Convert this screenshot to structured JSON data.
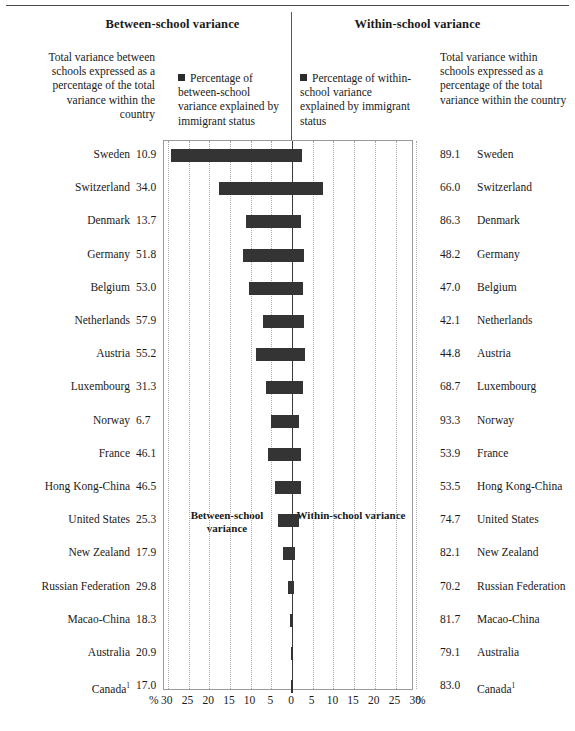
{
  "headers": {
    "left_title": "Between-school variance",
    "right_title": "Within-school variance",
    "left_blurb": "Total variance between schools expressed as a percentage of the total variance within the country",
    "right_blurb": "Total variance within schools expressed as a percentage of the total variance within the country"
  },
  "legend": {
    "left_label": "Percentage of between-school variance explained by immigrant status",
    "right_label": "Percentage of within-school variance explained by immigrant status",
    "marker_color": "#2b2b2b"
  },
  "inplot": {
    "left_label": "Between-school variance",
    "right_label": "Within-school variance"
  },
  "axis": {
    "left_unit": "%",
    "right_unit": "%",
    "ticks_left": [
      "30",
      "25",
      "20",
      "15",
      "10",
      "5"
    ],
    "tick_zero": "0",
    "ticks_right": [
      "5",
      "10",
      "15",
      "20",
      "25",
      "30"
    ]
  },
  "chart_data": {
    "type": "bar",
    "xlabel": "%",
    "ylabel": "",
    "xlim": [
      -30,
      30
    ],
    "grid": true,
    "orientation": "horizontal",
    "legend_position": "top",
    "categories": [
      "Sweden",
      "Switzerland",
      "Denmark",
      "Germany",
      "Belgium",
      "Netherlands",
      "Austria",
      "Luxembourg",
      "Norway",
      "France",
      "Hong Kong-China",
      "United States",
      "New Zealand",
      "Russian Federation",
      "Macao-China",
      "Australia",
      "Canada"
    ],
    "series": [
      {
        "name": "Total variance between schools expressed as a percentage of the total variance within the country",
        "values": [
          10.9,
          34.0,
          13.7,
          51.8,
          53.0,
          57.9,
          55.2,
          31.3,
          6.7,
          46.1,
          46.5,
          25.3,
          17.9,
          29.8,
          18.3,
          20.9,
          17.0
        ]
      },
      {
        "name": "Total variance within schools expressed as a percentage of the total variance within the country",
        "values": [
          89.1,
          66.0,
          86.3,
          48.2,
          47.0,
          42.1,
          44.8,
          68.7,
          93.3,
          53.9,
          53.5,
          74.7,
          82.1,
          70.2,
          81.7,
          79.1,
          83.0
        ]
      },
      {
        "name": "Percentage of between-school variance explained by immigrant status",
        "values": [
          29.2,
          17.6,
          11.2,
          11.8,
          10.4,
          7.0,
          8.6,
          6.3,
          5.0,
          5.8,
          4.1,
          3.4,
          2.2,
          0.9,
          0.6,
          0.2,
          0.2
        ]
      },
      {
        "name": "Percentage of within-school variance explained by immigrant status",
        "values": [
          2.4,
          7.5,
          2.1,
          2.9,
          2.7,
          2.9,
          3.1,
          2.6,
          1.6,
          2.2,
          2.2,
          1.8,
          0.8,
          0.4,
          0.3,
          0.2,
          0.2
        ]
      }
    ],
    "rows": [
      {
        "country": "Sweden",
        "footnote": "",
        "between_total": "10.9",
        "within_total": "89.1",
        "bar_left": 29.2,
        "bar_right": 2.4
      },
      {
        "country": "Switzerland",
        "footnote": "",
        "between_total": "34.0",
        "within_total": "66.0",
        "bar_left": 17.6,
        "bar_right": 7.5
      },
      {
        "country": "Denmark",
        "footnote": "",
        "between_total": "13.7",
        "within_total": "86.3",
        "bar_left": 11.2,
        "bar_right": 2.1
      },
      {
        "country": "Germany",
        "footnote": "",
        "between_total": "51.8",
        "within_total": "48.2",
        "bar_left": 11.8,
        "bar_right": 2.9
      },
      {
        "country": "Belgium",
        "footnote": "",
        "between_total": "53.0",
        "within_total": "47.0",
        "bar_left": 10.4,
        "bar_right": 2.7
      },
      {
        "country": "Netherlands",
        "footnote": "",
        "between_total": "57.9",
        "within_total": "42.1",
        "bar_left": 7.0,
        "bar_right": 2.9
      },
      {
        "country": "Austria",
        "footnote": "",
        "between_total": "55.2",
        "within_total": "44.8",
        "bar_left": 8.6,
        "bar_right": 3.1
      },
      {
        "country": "Luxembourg",
        "footnote": "",
        "between_total": "31.3",
        "within_total": "68.7",
        "bar_left": 6.3,
        "bar_right": 2.6
      },
      {
        "country": "Norway",
        "footnote": "",
        "between_total": "6.7",
        "within_total": "93.3",
        "bar_left": 5.0,
        "bar_right": 1.6
      },
      {
        "country": "France",
        "footnote": "",
        "between_total": "46.1",
        "within_total": "53.9",
        "bar_left": 5.8,
        "bar_right": 2.2
      },
      {
        "country": "Hong Kong-China",
        "footnote": "",
        "between_total": "46.5",
        "within_total": "53.5",
        "bar_left": 4.1,
        "bar_right": 2.2
      },
      {
        "country": "United States",
        "footnote": "",
        "between_total": "25.3",
        "within_total": "74.7",
        "bar_left": 3.4,
        "bar_right": 1.8
      },
      {
        "country": "New Zealand",
        "footnote": "",
        "between_total": "17.9",
        "within_total": "82.1",
        "bar_left": 2.2,
        "bar_right": 0.8
      },
      {
        "country": "Russian Federation",
        "footnote": "",
        "between_total": "29.8",
        "within_total": "70.2",
        "bar_left": 0.9,
        "bar_right": 0.4
      },
      {
        "country": "Macao-China",
        "footnote": "",
        "between_total": "18.3",
        "within_total": "81.7",
        "bar_left": 0.6,
        "bar_right": 0.3
      },
      {
        "country": "Australia",
        "footnote": "",
        "between_total": "20.9",
        "within_total": "79.1",
        "bar_left": 0.2,
        "bar_right": 0.2
      },
      {
        "country": "Canada",
        "footnote": "1",
        "between_total": "17.0",
        "within_total": "83.0",
        "bar_left": 0.2,
        "bar_right": 0.2
      }
    ]
  }
}
